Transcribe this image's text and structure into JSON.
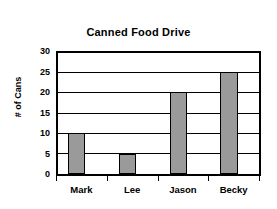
{
  "chart_data": {
    "type": "bar",
    "title": "Canned Food Drive",
    "xlabel": "",
    "ylabel": "# of Cans",
    "categories": [
      "Mark",
      "Lee",
      "Jason",
      "Becky"
    ],
    "values": [
      10,
      5,
      20,
      25
    ],
    "series": [
      {
        "name": "# of Cans",
        "values": [
          10,
          5,
          20,
          25
        ]
      }
    ],
    "ylim": [
      0,
      30
    ],
    "y_ticks": [
      0,
      5,
      10,
      15,
      20,
      25,
      30
    ],
    "y_tick_labels": [
      "0",
      "5",
      "10",
      "15",
      "20",
      "25",
      "30"
    ],
    "grid": "horizontal",
    "legend": "none",
    "colors": {
      "bar_fill": "#9a9a9a",
      "bar_edge": "#000000",
      "grid": "#000000",
      "axis": "#000000",
      "background": "#ffffff",
      "text": "#000000"
    }
  }
}
